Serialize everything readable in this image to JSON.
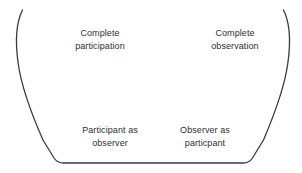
{
  "diagram": {
    "type": "continuum-funnel",
    "background_color": "#ffffff",
    "stroke_color": "#3a3a3a",
    "stroke_width": 1.3,
    "text_color": "#2e2e2e",
    "labels": [
      {
        "id": "complete-participation",
        "position": "top-left",
        "line1": "Complete",
        "line2": "participation"
      },
      {
        "id": "complete-observation",
        "position": "top-right",
        "line1": "Complete",
        "line2": "observation"
      },
      {
        "id": "participant-as-observer",
        "position": "bottom-left",
        "line1": "Participant as",
        "line2": "observer"
      },
      {
        "id": "observer-as-participant",
        "position": "bottom-right",
        "line1": "Observer as",
        "line2": "particpant"
      }
    ]
  }
}
